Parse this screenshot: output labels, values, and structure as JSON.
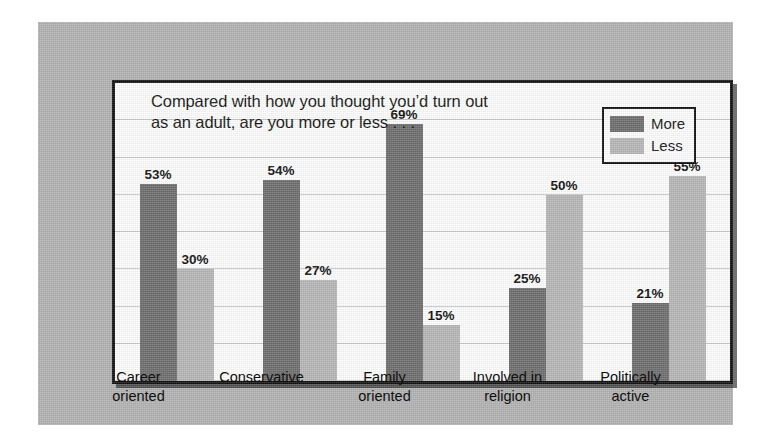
{
  "figure": {
    "background_color": "#ffffff",
    "panel_color": "#b2b2b2",
    "plot_background_color": "#fdfdfd",
    "frame_color": "#111111"
  },
  "title": {
    "text": "Compared with how you thought you’d turn out\nas an adult, are you more or less . . ."
  },
  "legend": {
    "position": "top-right",
    "entries": [
      {
        "label": "More",
        "color": "#6d6d6d",
        "swatch_name": "legend-swatch-more"
      },
      {
        "label": "Less",
        "color": "#b6b6b6",
        "swatch_name": "legend-swatch-less"
      }
    ]
  },
  "chart_data": {
    "type": "bar",
    "title": "Compared with how you thought you’d turn out as an adult, are you more or less . . .",
    "xlabel": "",
    "ylabel": "",
    "ylim": [
      0,
      80
    ],
    "grid": true,
    "gridlines": [
      0,
      10,
      20,
      30,
      40,
      50,
      60,
      70,
      80
    ],
    "value_suffix": "%",
    "legend_position": "top-right",
    "categories": [
      "Career\noriented",
      "Conservative",
      "Family\noriented",
      "Involved in\nreligion",
      "Politically\nactive"
    ],
    "series": [
      {
        "name": "More",
        "color": "#6d6d6d",
        "values": [
          53,
          54,
          69,
          25,
          21
        ],
        "labels": [
          "53%",
          "54%",
          "69%",
          "25%",
          "21%"
        ]
      },
      {
        "name": "Less",
        "color": "#b6b6b6",
        "values": [
          30,
          27,
          15,
          50,
          55
        ],
        "labels": [
          "30%",
          "27%",
          "15%",
          "50%",
          "55%"
        ]
      }
    ]
  }
}
